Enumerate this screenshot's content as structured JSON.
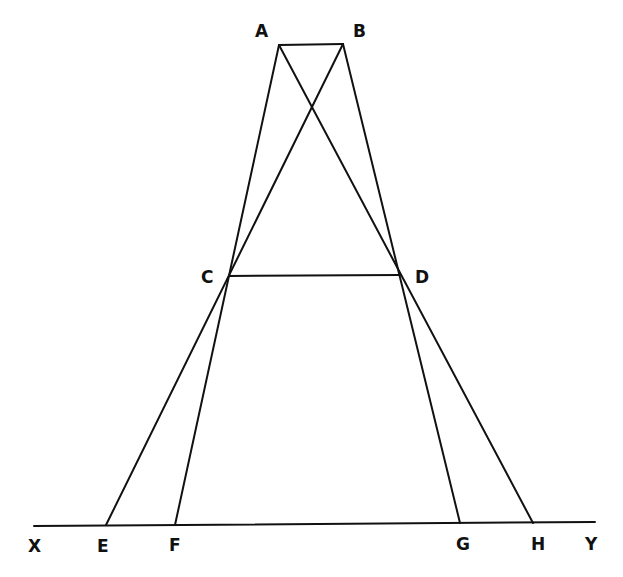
{
  "diagram": {
    "type": "geometric-construction",
    "points": {
      "A": {
        "label": "A",
        "x": 279,
        "y": 45
      },
      "B": {
        "label": "B",
        "x": 343,
        "y": 44
      },
      "C": {
        "label": "C",
        "x": 229,
        "y": 276
      },
      "D": {
        "label": "D",
        "x": 400,
        "y": 275
      },
      "E": {
        "label": "E",
        "x": 106,
        "y": 525
      },
      "F": {
        "label": "F",
        "x": 175,
        "y": 525
      },
      "G": {
        "label": "G",
        "x": 460,
        "y": 523
      },
      "H": {
        "label": "H",
        "x": 533,
        "y": 523
      },
      "X": {
        "label": "X",
        "x": 34,
        "y": 526
      },
      "Y": {
        "label": "Y",
        "x": 595,
        "y": 522
      }
    },
    "segments": [
      [
        "A",
        "B"
      ],
      [
        "C",
        "D"
      ],
      [
        "X",
        "Y"
      ],
      [
        "A",
        "F"
      ],
      [
        "B",
        "E"
      ],
      [
        "A",
        "H"
      ],
      [
        "B",
        "G"
      ]
    ],
    "labels": {
      "A": "A",
      "B": "B",
      "C": "C",
      "D": "D",
      "E": "E",
      "F": "F",
      "G": "G",
      "H": "H",
      "X": "X",
      "Y": "Y"
    }
  }
}
